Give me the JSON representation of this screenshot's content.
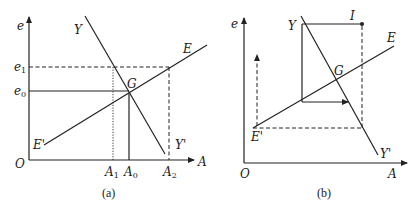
{
  "panel_a": {
    "caption": "(a)",
    "axis_y_label": "e",
    "axis_x_label": "A",
    "origin_label": "O",
    "curve_Y_top": "Y",
    "curve_Y_bottom": "Y'",
    "curve_E_top": "E",
    "curve_E_bottom": "E'",
    "intersection": "G",
    "e1_main": "e",
    "e1_sub": "1",
    "e0_main": "e",
    "e0_sub": "0",
    "A1_main": "A",
    "A1_sub": "1",
    "A0_main": "A",
    "A0_sub": "0",
    "A2_main": "A",
    "A2_sub": "2"
  },
  "panel_b": {
    "caption": "(b)",
    "axis_y_label": "e",
    "axis_x_label": "A",
    "origin_label": "O",
    "curve_Y_top": "Y",
    "curve_Y_bottom": "Y'",
    "curve_E_top": "E",
    "curve_E_bottom": "E'",
    "intersection": "G",
    "point_I": "I"
  }
}
